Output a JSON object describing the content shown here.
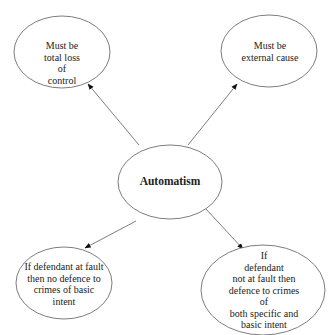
{
  "diagram": {
    "type": "mind-map",
    "center": {
      "label": "Automatism"
    },
    "nodes": [
      {
        "id": "top-left",
        "label": "Must be\ntotal loss\nof\ncontrol"
      },
      {
        "id": "top-right",
        "label": "Must be\nexternal cause"
      },
      {
        "id": "bottom-left",
        "label": "If defendant at fault\nthen no defence to\ncrimes of basic\nintent"
      },
      {
        "id": "bottom-right",
        "label": "If\ndefendant\nnot at fault then\ndefence to crimes of\nboth specific and\nbasic intent"
      }
    ],
    "edges": [
      {
        "from": "center",
        "to": "top-left"
      },
      {
        "from": "center",
        "to": "top-right"
      },
      {
        "from": "center",
        "to": "bottom-left"
      },
      {
        "from": "center",
        "to": "bottom-right"
      }
    ],
    "colors": {
      "stroke": "#6e6e6e",
      "text": "#222222",
      "background": "#ffffff"
    }
  }
}
